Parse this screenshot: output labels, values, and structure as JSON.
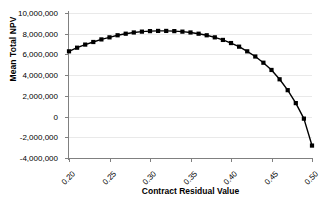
{
  "chart_data": {
    "type": "line",
    "title": "",
    "xlabel": "Contract Residual Value",
    "ylabel": "Mean Total NPV",
    "xlim": [
      0.2,
      0.5
    ],
    "ylim": [
      -4000000,
      10000000
    ],
    "grid": true,
    "legend": false,
    "marker": "filled-square",
    "line_color": "#000000",
    "marker_color": "#000000",
    "gridline_color": "#e9e9e9",
    "axis_color": "#808080",
    "x_tick_labels": [
      "0.20",
      "0.25",
      "0.30",
      "0.35",
      "0.40",
      "0.45",
      "0.50"
    ],
    "x_tick_values": [
      0.2,
      0.25,
      0.3,
      0.35,
      0.4,
      0.45,
      0.5
    ],
    "y_tick_labels": [
      "10,000,000",
      "8,000,000",
      "6,000,000",
      "4,000,000",
      "2,000,000",
      "0",
      "-2,000,000",
      "-4,000,000"
    ],
    "y_tick_values": [
      10000000,
      8000000,
      6000000,
      4000000,
      2000000,
      0,
      -2000000,
      -4000000
    ],
    "x": [
      0.2,
      0.21,
      0.22,
      0.23,
      0.24,
      0.25,
      0.26,
      0.27,
      0.28,
      0.29,
      0.3,
      0.31,
      0.32,
      0.33,
      0.34,
      0.35,
      0.36,
      0.37,
      0.38,
      0.39,
      0.4,
      0.41,
      0.42,
      0.43,
      0.44,
      0.45,
      0.46,
      0.47,
      0.48,
      0.49,
      0.5
    ],
    "values": [
      6300000,
      6650000,
      6950000,
      7200000,
      7450000,
      7650000,
      7850000,
      8000000,
      8120000,
      8200000,
      8250000,
      8270000,
      8270000,
      8250000,
      8200000,
      8120000,
      8000000,
      7850000,
      7650000,
      7400000,
      7100000,
      6750000,
      6300000,
      5800000,
      5200000,
      4500000,
      3600000,
      2550000,
      1300000,
      -200000,
      -2800000
    ],
    "series": [
      {
        "name": "Mean Total NPV",
        "values": [
          6300000,
          6650000,
          6950000,
          7200000,
          7450000,
          7650000,
          7850000,
          8000000,
          8120000,
          8200000,
          8250000,
          8270000,
          8270000,
          8250000,
          8200000,
          8120000,
          8000000,
          7850000,
          7650000,
          7400000,
          7100000,
          6750000,
          6300000,
          5800000,
          5200000,
          4500000,
          3600000,
          2550000,
          1300000,
          -200000,
          -2800000
        ]
      }
    ]
  }
}
